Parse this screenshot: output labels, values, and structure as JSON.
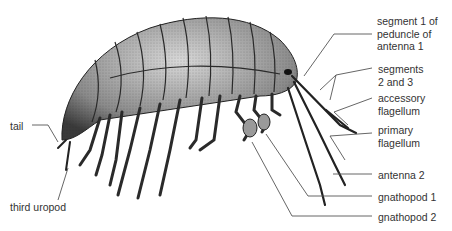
{
  "diagram": {
    "labels": {
      "segment1": "segment 1 of\npeduncle of\nantenna 1",
      "segments23": "segments\n2 and 3",
      "accessory": "accessory\nflagellum",
      "primary": "primary\nflagellum",
      "antenna2": "antenna 2",
      "gnathopod1": "gnathopod 1",
      "gnathopod2": "gnathopod 2",
      "tail": "tail",
      "uropod": "third uropod"
    },
    "colors": {
      "ink": "#222222",
      "body_dark": "#3a3a3a",
      "body_mid": "#8a8a8a",
      "body_light": "#cfcfcf",
      "text": "#333333"
    }
  }
}
